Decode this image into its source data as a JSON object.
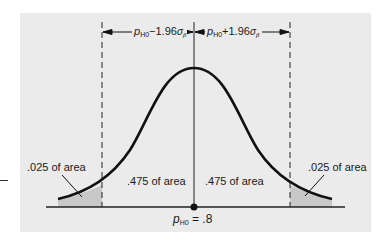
{
  "diagram": {
    "type": "normal-distribution-two-tailed",
    "dimension_left": {
      "base": "p",
      "base_sub": "H0",
      "op": "−1.96",
      "sigma": "σ",
      "sigma_sub": "p̂"
    },
    "dimension_right": {
      "base": "p",
      "base_sub": "H0",
      "op": "+1.96",
      "sigma": "σ",
      "sigma_sub": "p̂"
    },
    "regions": {
      "left_tail": ".025 of area",
      "left_center": ".475 of area",
      "right_center": ".475 of area",
      "right_tail": ".025 of area"
    },
    "center_label": {
      "base": "p",
      "base_sub": "H0",
      "value": "= .8"
    },
    "colors": {
      "panel": "#ebebeb",
      "tail_shade": "#c8c8c8",
      "curve": "#111111"
    }
  }
}
